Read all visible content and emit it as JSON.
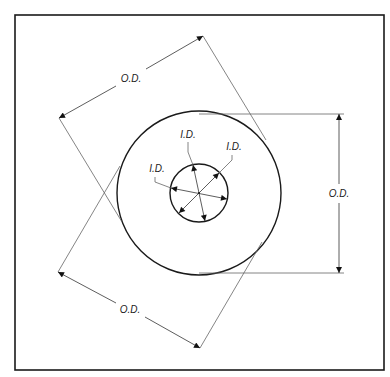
{
  "diagram": {
    "labels": {
      "outer_diameter": "O.D.",
      "inner_diameter": "I.D."
    },
    "dimensions": [
      {
        "id": "od-top-left",
        "text": "O.D."
      },
      {
        "id": "od-right",
        "text": "O.D."
      },
      {
        "id": "od-bottom-left",
        "text": "O.D."
      },
      {
        "id": "id-left",
        "text": "I.D."
      },
      {
        "id": "id-top",
        "text": "I.D."
      },
      {
        "id": "id-top-right",
        "text": "I.D."
      }
    ],
    "colors": {
      "line": "#1a1a1a",
      "extension_line": "#666666",
      "background": "#ffffff"
    }
  }
}
